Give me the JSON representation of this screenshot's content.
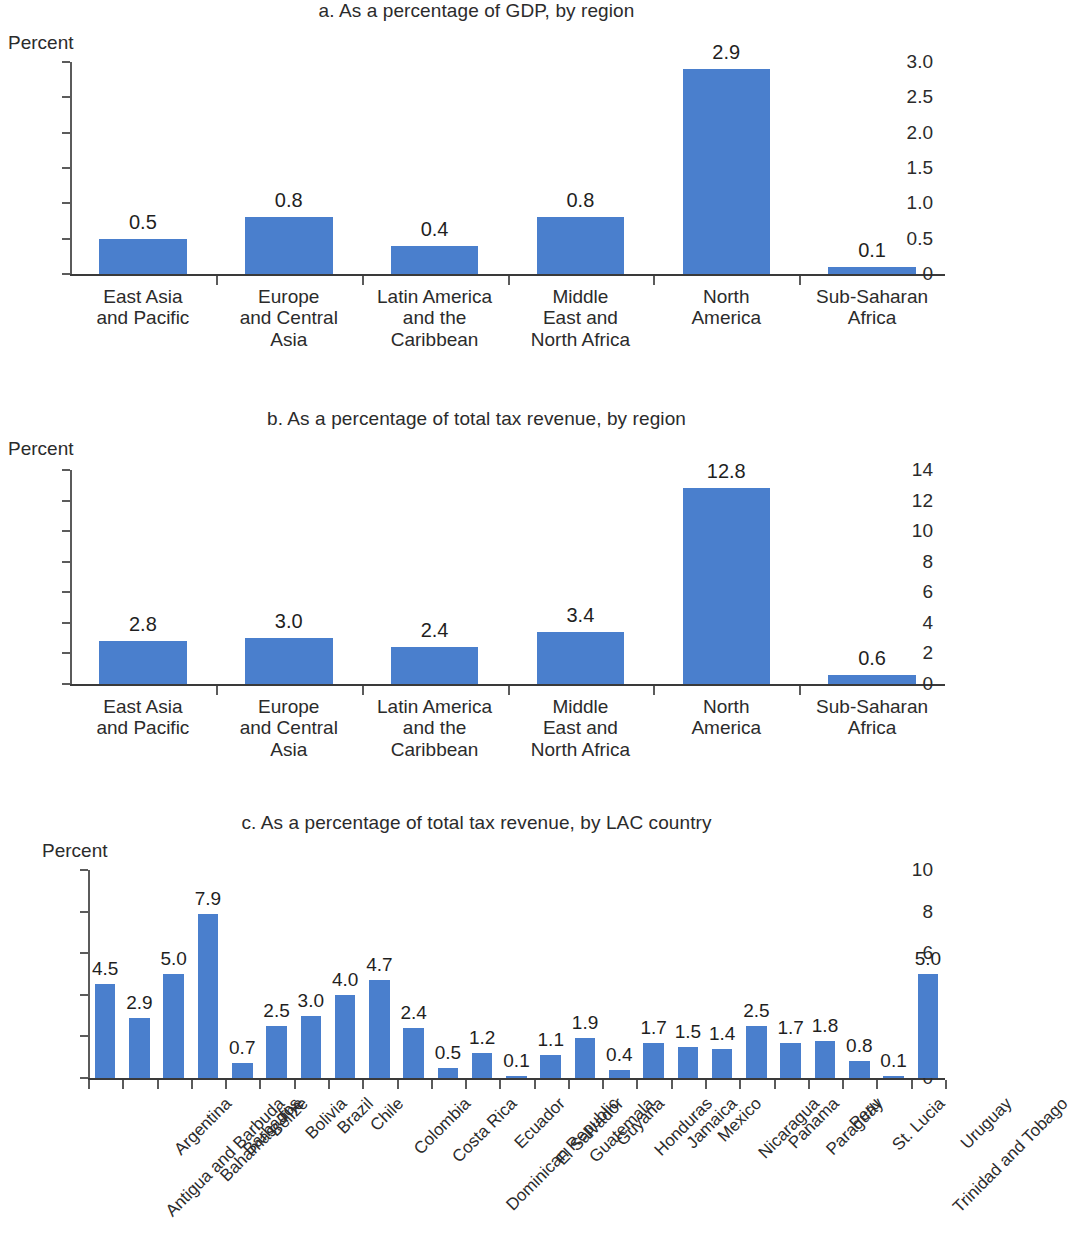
{
  "figure": {
    "axis_unit_label": "Percent",
    "bar_color": "#4a7fcd",
    "text_color": "#2b2b2b"
  },
  "panels": [
    {
      "id": "a",
      "title": "a. As a percentage of GDP, by region",
      "unit": "Percent"
    },
    {
      "id": "b",
      "title": "b. As a percentage of total tax revenue, by region",
      "unit": "Percent"
    },
    {
      "id": "c",
      "title": "c. As a percentage of total tax revenue, by LAC country",
      "unit": "Percent"
    }
  ],
  "chart_data": [
    {
      "type": "bar",
      "panel": "a",
      "title": "a. As a percentage of GDP, by region",
      "xlabel": "",
      "ylabel": "Percent",
      "ylim": [
        0,
        3.0
      ],
      "yticks": [
        0,
        0.5,
        1.0,
        1.5,
        2.0,
        2.5,
        3.0
      ],
      "ytick_labels": [
        "0",
        "0.5",
        "1.0",
        "1.5",
        "2.0",
        "2.5",
        "3.0"
      ],
      "grid": false,
      "legend": "none",
      "categories": [
        "East Asia\nand Pacific",
        "Europe\nand Central\nAsia",
        "Latin America\nand the\nCaribbean",
        "Middle\nEast and\nNorth Africa",
        "North\nAmerica",
        "Sub-Saharan\nAfrica"
      ],
      "values": [
        0.5,
        0.8,
        0.4,
        0.8,
        2.9,
        0.1
      ],
      "data_labels": [
        "0.5",
        "0.8",
        "0.4",
        "0.8",
        "2.9",
        "0.1"
      ]
    },
    {
      "type": "bar",
      "panel": "b",
      "title": "b. As a percentage of total tax revenue, by region",
      "xlabel": "",
      "ylabel": "Percent",
      "ylim": [
        0,
        14
      ],
      "yticks": [
        0,
        2,
        4,
        6,
        8,
        10,
        12,
        14
      ],
      "ytick_labels": [
        "0",
        "2",
        "4",
        "6",
        "8",
        "10",
        "12",
        "14"
      ],
      "grid": false,
      "legend": "none",
      "categories": [
        "East Asia\nand Pacific",
        "Europe\nand Central\nAsia",
        "Latin America\nand the\nCaribbean",
        "Middle\nEast and\nNorth Africa",
        "North\nAmerica",
        "Sub-Saharan\nAfrica"
      ],
      "values": [
        2.8,
        3.0,
        2.4,
        3.4,
        12.8,
        0.6
      ],
      "data_labels": [
        "2.8",
        "3.0",
        "2.4",
        "3.4",
        "12.8",
        "0.6"
      ]
    },
    {
      "type": "bar",
      "panel": "c",
      "title": "c. As a percentage of total tax revenue, by LAC country",
      "xlabel": "",
      "ylabel": "Percent",
      "ylim": [
        0,
        10
      ],
      "yticks": [
        0,
        2,
        4,
        6,
        8,
        10
      ],
      "ytick_labels": [
        "0",
        "2",
        "4",
        "6",
        "8",
        "10"
      ],
      "grid": false,
      "legend": "none",
      "categories": [
        "Antigua and Barbuda",
        "Argentina",
        "Bahamas, The",
        "Barbados",
        "Belize",
        "Bolivia",
        "Brazil",
        "Chile",
        "Colombia",
        "Costa Rica",
        "Dominican Republic",
        "Ecuador",
        "El Salvador",
        "Guatemala",
        "Guyana",
        "Honduras",
        "Jamaica",
        "Mexico",
        "Nicaragua",
        "Panama",
        "Paraguay",
        "Peru",
        "St. Lucia",
        "Trinidad and Tobago",
        "Uruguay"
      ],
      "values": [
        4.5,
        2.9,
        5.0,
        7.9,
        0.7,
        2.5,
        3.0,
        4.0,
        4.7,
        2.4,
        0.5,
        1.2,
        0.1,
        1.1,
        1.9,
        0.4,
        1.7,
        1.5,
        1.4,
        2.5,
        1.7,
        1.8,
        0.8,
        0.1,
        5.0
      ],
      "data_labels": [
        "4.5",
        "2.9",
        "5.0",
        "7.9",
        "0.7",
        "2.5",
        "3.0",
        "4.0",
        "4.7",
        "2.4",
        "0.5",
        "1.2",
        "0.1",
        "1.1",
        "1.9",
        "0.4",
        "1.7",
        "1.5",
        "1.4",
        "2.5",
        "1.7",
        "1.8",
        "0.8",
        "0.1",
        "5.0"
      ]
    }
  ]
}
